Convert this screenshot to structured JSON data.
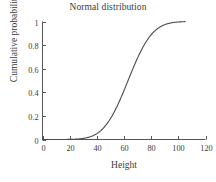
{
  "chart_data": {
    "type": "line",
    "title": "Normal distribution",
    "xlabel": "Height",
    "ylabel": "Cumulative probability",
    "xlim": [
      0,
      120
    ],
    "ylim": [
      0,
      1
    ],
    "xticks": [
      0,
      20,
      40,
      60,
      80,
      100,
      120
    ],
    "xtick_labels": [
      "0",
      "20",
      "40",
      "60",
      "80",
      "100",
      "120"
    ],
    "yticks": [
      0,
      0.2,
      0.4,
      0.6,
      0.8,
      1
    ],
    "ytick_labels": [
      "0",
      "0.2",
      "0.4",
      "0.6",
      "0.8",
      "1"
    ],
    "grid": false,
    "legend": null,
    "series": [
      {
        "name": "Cumulative probability",
        "color": "#4a4a4a",
        "linewidth": 1.1,
        "distribution": "normal-cdf",
        "mean": 63,
        "sd": 14,
        "x": [
          0,
          5,
          10,
          15,
          20,
          25,
          30,
          32,
          34,
          36,
          38,
          40,
          42,
          44,
          46,
          48,
          50,
          52,
          54,
          56,
          58,
          60,
          62,
          64,
          66,
          68,
          70,
          72,
          74,
          76,
          78,
          80,
          82,
          84,
          86,
          88,
          90,
          92,
          95,
          100,
          105
        ],
        "y": [
          0.0,
          0.0,
          0.0001,
          0.0005,
          0.0018,
          0.0056,
          0.0152,
          0.0122,
          0.0189,
          0.0273,
          0.0385,
          0.0527,
          0.0706,
          0.0927,
          0.1195,
          0.1513,
          0.1884,
          0.2306,
          0.2776,
          0.3289,
          0.3632,
          0.4152,
          0.4715,
          0.5284,
          0.5847,
          0.6387,
          0.6891,
          0.7349,
          0.7755,
          0.8106,
          0.8404,
          0.8652,
          0.8855,
          0.9019,
          0.9151,
          0.9255,
          0.9338,
          0.9404,
          0.9482,
          0.9566,
          0.9619
        ]
      }
    ]
  },
  "axes": {
    "tick_direction": "in",
    "spines": [
      "left",
      "bottom"
    ],
    "axis_color": "#555555"
  }
}
